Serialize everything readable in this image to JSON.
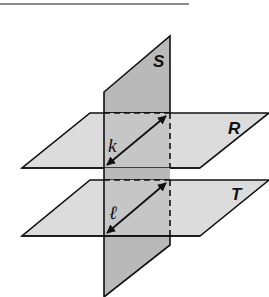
{
  "figure": {
    "type": "three-planes-diagram",
    "colors": {
      "plane_light": "#dcdcdc",
      "plane_dark": "#b9b9b9",
      "stroke": "#111111",
      "rule": "#8a8a8a"
    },
    "planes": [
      {
        "id": "S",
        "label": "S",
        "orientation": "vertical"
      },
      {
        "id": "R",
        "label": "R",
        "orientation": "horizontal"
      },
      {
        "id": "T",
        "label": "T",
        "orientation": "horizontal"
      }
    ],
    "lines": [
      {
        "id": "k",
        "label": "k",
        "intersection_of": [
          "S",
          "R"
        ]
      },
      {
        "id": "l",
        "label": "ℓ",
        "intersection_of": [
          "S",
          "T"
        ]
      }
    ]
  }
}
